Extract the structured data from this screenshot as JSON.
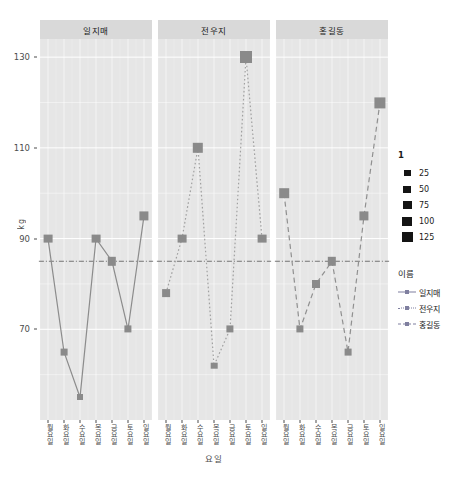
{
  "chart_data": {
    "type": "line",
    "title": "",
    "xlabel": "요일",
    "ylabel": "kg",
    "x": [
      "월요일",
      "화요일",
      "수요일",
      "목요일",
      "금요일",
      "토요일",
      "일요일"
    ],
    "ylim": [
      50,
      134
    ],
    "yticks": [
      70,
      90,
      110,
      130
    ],
    "grid": true,
    "facet_by": "이름",
    "facets": [
      "일지매",
      "전우지",
      "홍길동"
    ],
    "reference_line": 85,
    "series": [
      {
        "name": "일지매",
        "values": [
          90,
          65,
          55,
          90,
          85,
          70,
          95
        ],
        "linestyle": "solid",
        "color": "#8c8c8c"
      },
      {
        "name": "전우지",
        "values": [
          78,
          90,
          110,
          62,
          70,
          130,
          90
        ],
        "linestyle": "dotted",
        "color": "#a0a0a0"
      },
      {
        "name": "홍길동",
        "values": [
          100,
          70,
          80,
          85,
          65,
          95,
          120
        ],
        "linestyle": "dashed",
        "color": "#909090"
      }
    ]
  },
  "axes": {
    "y_title": "kg",
    "x_title": "요일",
    "y_ticks": [
      "130",
      "110",
      "90",
      "70"
    ],
    "x_ticks": [
      "월요일",
      "화요일",
      "수요일",
      "목요일",
      "금요일",
      "토요일",
      "일요일"
    ]
  },
  "facet_strips": [
    "일지매",
    "전우지",
    "홍길동"
  ],
  "legends": {
    "size": {
      "title": "1",
      "items": [
        {
          "label": "25",
          "size": 7
        },
        {
          "label": "50",
          "size": 8
        },
        {
          "label": "75",
          "size": 9
        },
        {
          "label": "100",
          "size": 10
        },
        {
          "label": "125",
          "size": 11
        }
      ]
    },
    "color": {
      "title": "이름",
      "items": [
        {
          "label": "일지매",
          "linestyle": "solid"
        },
        {
          "label": "전우지",
          "linestyle": "dotted"
        },
        {
          "label": "홍길동",
          "linestyle": "dashed"
        }
      ]
    }
  },
  "colors": {
    "panel_bg": "#e6e6e6",
    "strip_bg": "#d9d9d9",
    "grid": "#ffffff",
    "point": "#8a8a8a",
    "text": "#4d4d4d",
    "refline": "#555555"
  }
}
